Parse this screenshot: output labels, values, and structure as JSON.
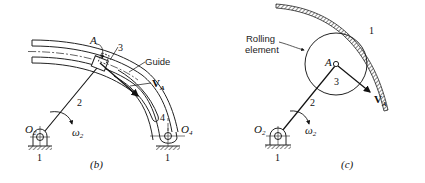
{
  "figure_b": {
    "caption": "(b)",
    "labels": {
      "point_a": "A",
      "link_3": "3",
      "guide": "Guide",
      "velocity": "V",
      "velocity_sub": "A",
      "link_2": "2",
      "link_4": "4",
      "pivot_o2": "O",
      "pivot_o2_sub": "2",
      "pivot_o4": "O",
      "pivot_o4_sub": "4",
      "omega": "ω",
      "omega_sub": "2",
      "ground_left": "1",
      "ground_right": "1"
    }
  },
  "figure_c": {
    "caption": "(c)",
    "labels": {
      "rolling_line1": "Rolling",
      "rolling_line2": "element",
      "surface_1": "1",
      "point_a": "A",
      "link_3": "3",
      "link_2": "2",
      "velocity": "V",
      "velocity_sub": "A",
      "pivot_o2": "O",
      "pivot_o2_sub": "2",
      "omega": "ω",
      "omega_sub": "2",
      "ground": "1"
    }
  }
}
